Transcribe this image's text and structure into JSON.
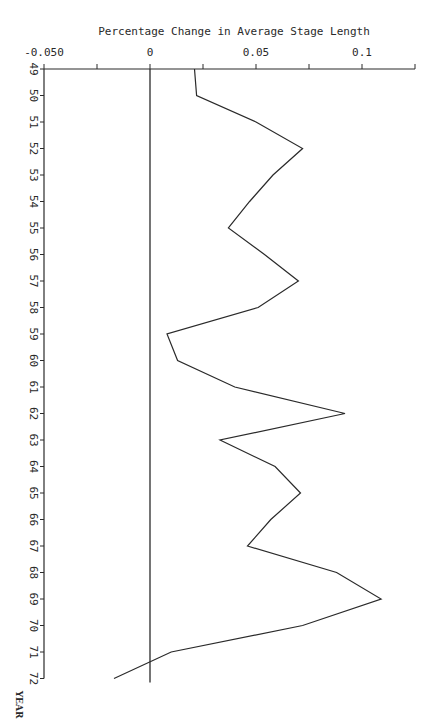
{
  "chart_data": {
    "type": "line",
    "orientation": "vertical-time-axis",
    "title": "Percentage Change in Average Stage Length",
    "xlabel": "Percentage Change in Average Stage Length",
    "ylabel": "YEAR",
    "x_tick_labels": [
      "-0.050",
      "0",
      "0.05",
      "0.1"
    ],
    "x_tick_values": [
      -0.05,
      0,
      0.05,
      0.1
    ],
    "x_minor_ticks": [
      -0.025,
      0.025,
      0.075,
      0.125
    ],
    "xlim": [
      -0.05,
      0.125
    ],
    "categories": [
      "49",
      "50",
      "51",
      "52",
      "53",
      "54",
      "55",
      "56",
      "57",
      "58",
      "59",
      "60",
      "61",
      "62",
      "63",
      "64",
      "65",
      "66",
      "67",
      "68",
      "69",
      "70",
      "71",
      "72"
    ],
    "values": [
      0.021,
      0.022,
      0.05,
      0.072,
      0.058,
      0.047,
      0.037,
      0.054,
      0.07,
      0.051,
      0.008,
      0.013,
      0.04,
      0.092,
      0.033,
      0.059,
      0.071,
      0.057,
      0.046,
      0.088,
      0.109,
      0.072,
      0.01,
      -0.017
    ],
    "reference_line": {
      "x": 0,
      "label": "zero line"
    },
    "grid": false,
    "legend": null
  },
  "colors": {
    "ink": "#2a2a2a",
    "background": "#ffffff"
  }
}
